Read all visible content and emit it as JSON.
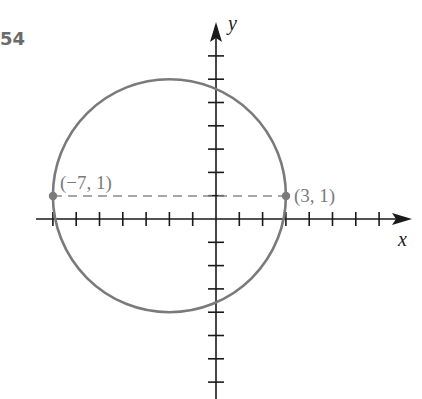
{
  "problem_number": "54",
  "axes": {
    "x_label": "x",
    "y_label": "y"
  },
  "points": [
    {
      "label": "(−7, 1)",
      "x": -7,
      "y": 1
    },
    {
      "label": "(3, 1)",
      "x": 3,
      "y": 1
    }
  ],
  "colors": {
    "circle": "#7a7a7a",
    "axes": "#1a1a1a",
    "dashed": "#8a8a8a"
  },
  "chart_data": {
    "type": "diagram",
    "title": "54",
    "shapes": [
      {
        "kind": "circle",
        "center": [
          -2,
          1
        ],
        "radius": 5
      },
      {
        "kind": "dashed_segment",
        "from": [
          -7,
          1
        ],
        "to": [
          3,
          1
        ]
      }
    ],
    "points": [
      {
        "label": "(−7, 1)",
        "x": -7,
        "y": 1
      },
      {
        "label": "(3, 1)",
        "x": 3,
        "y": 1
      }
    ],
    "xlabel": "x",
    "ylabel": "y",
    "xlim": [
      -7,
      8
    ],
    "ylim": [
      -7,
      8
    ],
    "grid": false
  }
}
